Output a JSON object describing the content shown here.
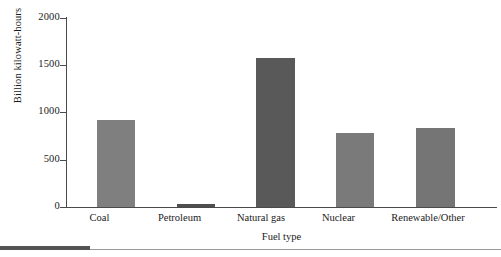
{
  "chart_data": {
    "type": "bar",
    "title": "",
    "xlabel": "Fuel type",
    "ylabel": "Billion kilowatt-hours",
    "categories": [
      "Coal",
      "Petroleum",
      "Natural gas",
      "Nuclear",
      "Renewable/Other"
    ],
    "values": [
      920,
      30,
      1575,
      785,
      835
    ],
    "ylim": [
      0,
      2000
    ],
    "yticks": [
      0,
      500,
      1000,
      1500,
      2000
    ],
    "ytick_labels": [
      "0",
      "500",
      "1000",
      "1500",
      "2000"
    ],
    "grid": false,
    "legend": null,
    "bar_colors": [
      "#7f7f7f",
      "#4f4f4f",
      "#595959",
      "#7a7a7a",
      "#757575"
    ],
    "series": [
      {
        "name": "Electricity generation",
        "values": [
          920,
          30,
          1575,
          785,
          835
        ]
      }
    ]
  },
  "axis": {
    "y_title": "Billion kilowatt-hours",
    "x_title": "Fuel type",
    "tick_0": "0",
    "tick_500": "500",
    "tick_1000": "1000",
    "tick_1500": "1500",
    "tick_2000": "2000"
  },
  "categories": {
    "c0": "Coal",
    "c1": "Petroleum",
    "c2": "Natural gas",
    "c3": "Nuclear",
    "c4": "Renewable/Other"
  },
  "colors": {
    "axis_line": "#4a4a4a",
    "text": "#1a1a1a",
    "bar_default": "#7f7f7f",
    "bar_highlight": "#595959",
    "footer_thick": "#535353",
    "footer_thin": "#9a9a9a",
    "background": "#ffffff"
  }
}
